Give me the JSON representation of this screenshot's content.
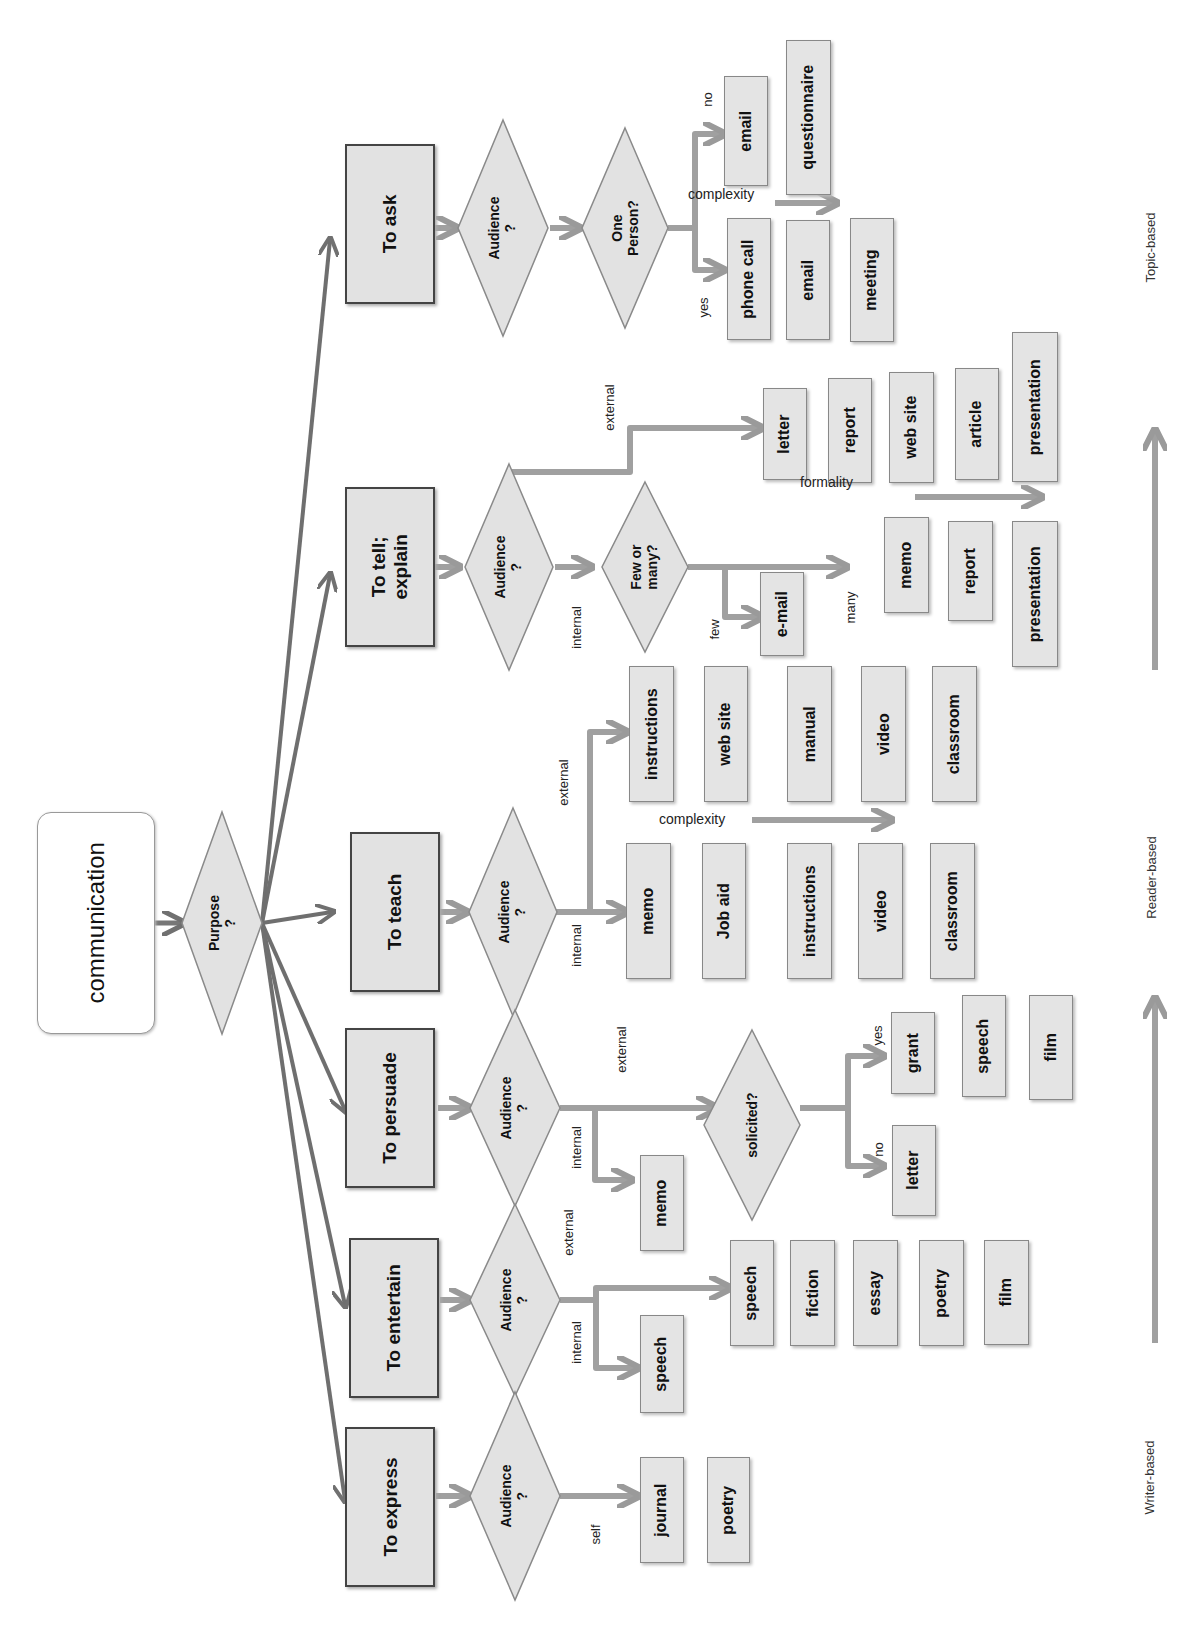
{
  "root": {
    "label": "communication"
  },
  "purpose_decision": {
    "label": "Purpose\n?"
  },
  "purposes": [
    {
      "label": "To ask"
    },
    {
      "label": "To tell;\nexplain"
    },
    {
      "label": "To teach"
    },
    {
      "label": "To persuade"
    },
    {
      "label": "To entertain"
    },
    {
      "label": "To express"
    }
  ],
  "decisions": {
    "audience": "Audience\n?",
    "one_person": "One\nPerson?",
    "few_or_many": "Few or\nmany?",
    "solicited": "solicited?"
  },
  "edge_labels": {
    "no": "no",
    "yes": "yes",
    "external": "external",
    "internal": "internal",
    "few": "few",
    "many": "many",
    "self": "self"
  },
  "scale_labels": {
    "complexity": "complexity",
    "formality": "formality"
  },
  "ask": {
    "no_items": [
      "email",
      "questionnaire"
    ],
    "yes_items": [
      "phone call",
      "email",
      "meeting"
    ]
  },
  "tell": {
    "external_items": [
      "letter",
      "report",
      "web site",
      "article",
      "presentation"
    ],
    "few_items": [
      "e-mail"
    ],
    "many_items": [
      "memo",
      "report",
      "presentation"
    ]
  },
  "teach": {
    "external_items": [
      "instructions",
      "web site",
      "manual",
      "video",
      "classroom"
    ],
    "internal_items": [
      "memo",
      "Job aid",
      "instructions",
      "video",
      "classroom"
    ]
  },
  "persuade": {
    "internal_items": [
      "memo"
    ],
    "yes_items": [
      "grant",
      "speech",
      "film"
    ],
    "no_items": [
      "letter"
    ]
  },
  "entertain": {
    "internal_items": [
      "speech"
    ],
    "external_items": [
      "speech",
      "fiction",
      "essay",
      "poetry",
      "film"
    ]
  },
  "express": {
    "self_items": [
      "journal",
      "poetry"
    ]
  },
  "axis": {
    "top": "Topic-based",
    "middle": "Reader-based",
    "bottom": "Writer-based"
  }
}
